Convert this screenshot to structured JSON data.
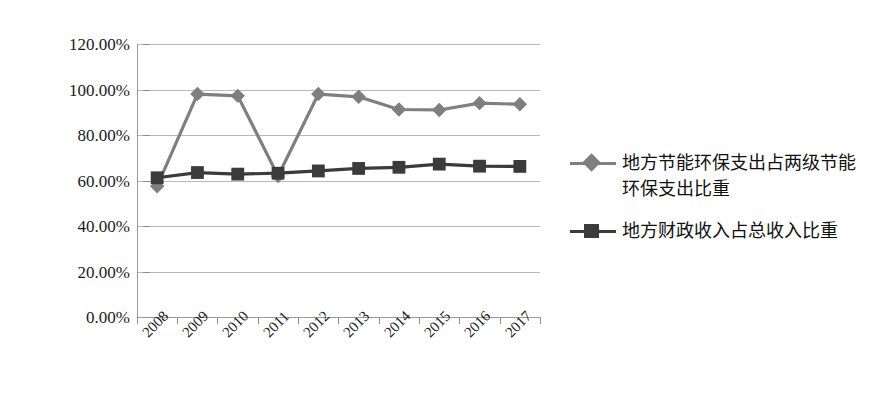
{
  "chart_data": {
    "type": "line",
    "title": "",
    "xlabel": "",
    "ylabel": "",
    "categories": [
      "2008",
      "2009",
      "2010",
      "2011",
      "2012",
      "2013",
      "2014",
      "2015",
      "2016",
      "2017"
    ],
    "ylim": [
      0,
      1.2
    ],
    "ytick_labels": [
      "120.00%",
      "100.00%",
      "80.00%",
      "60.00%",
      "40.00%",
      "20.00%",
      "0.00%"
    ],
    "ytick_values": [
      1.2,
      1.0,
      0.8,
      0.6,
      0.4,
      0.2,
      0.0
    ],
    "grid": true,
    "legend_position": "right",
    "series": [
      {
        "name": "地方节能环保支出占两级节能环保支出比重",
        "marker": "diamond",
        "color": "#7f7f7f",
        "values": [
          0.575,
          0.98,
          0.972,
          0.62,
          0.98,
          0.968,
          0.912,
          0.91,
          0.94,
          0.935
        ]
      },
      {
        "name": "地方财政收入占总收入比重",
        "marker": "square",
        "color": "#3b3b3b",
        "values": [
          0.612,
          0.635,
          0.628,
          0.632,
          0.642,
          0.653,
          0.658,
          0.672,
          0.663,
          0.662
        ]
      }
    ]
  },
  "legend": {
    "entries": [
      {
        "label": "地方节能环保支出占两级节能环保支出比重",
        "marker": "diamond-marker-icon",
        "color": "#7f7f7f"
      },
      {
        "label": "地方财政收入占总收入比重",
        "marker": "square-marker-icon",
        "color": "#3b3b3b"
      }
    ]
  },
  "colors": {
    "series_1": "#7f7f7f",
    "series_2": "#3b3b3b",
    "gridline": "#b9b9b9",
    "axis": "#9a9a9a",
    "background": "#ffffff",
    "text": "#1a1a1a"
  }
}
